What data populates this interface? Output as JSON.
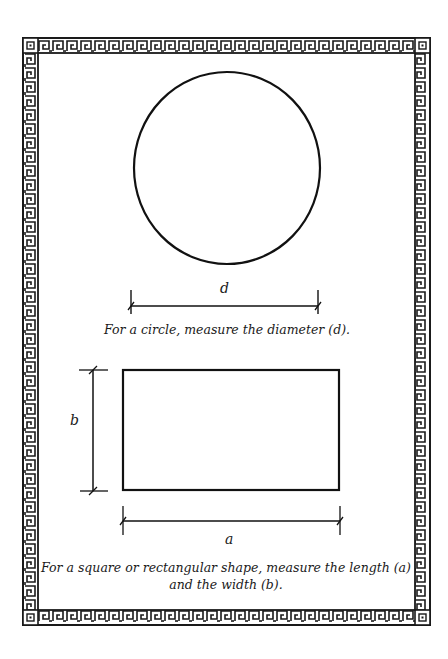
{
  "diagram": {
    "border": {
      "style": "greek-key meander frame",
      "color": "#1a1a1a"
    },
    "circle": {
      "label": "d",
      "caption": "For a circle, measure the diameter (d)."
    },
    "rectangle": {
      "width_label": "a",
      "height_label": "b",
      "caption_line1": "For a square or rectangular shape, measure the length (a)",
      "caption_line2": "and the width (b)."
    }
  }
}
